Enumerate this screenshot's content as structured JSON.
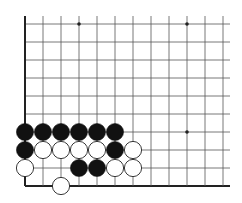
{
  "board": {
    "description": "Go board corner diagram (lower-left corner)",
    "origin_x": 25,
    "origin_y": 24,
    "spacing": 18,
    "cols": 12,
    "rows": 10,
    "right_extent": 230,
    "edges": {
      "left": true,
      "bottom": true,
      "top": false,
      "right": false
    },
    "line_color": "#555555",
    "edge_color": "#222222",
    "star_points": [
      {
        "col": 3,
        "row": 0
      },
      {
        "col": 9,
        "row": 0
      },
      {
        "col": 9,
        "row": 6
      }
    ],
    "stones": [
      {
        "color": "black",
        "col": 0,
        "row": 6
      },
      {
        "color": "black",
        "col": 1,
        "row": 6
      },
      {
        "color": "black",
        "col": 2,
        "row": 6
      },
      {
        "color": "black",
        "col": 3,
        "row": 6
      },
      {
        "color": "black",
        "col": 4,
        "row": 6
      },
      {
        "color": "black",
        "col": 5,
        "row": 6
      },
      {
        "color": "black",
        "col": 0,
        "row": 7
      },
      {
        "color": "white",
        "col": 1,
        "row": 7
      },
      {
        "color": "white",
        "col": 2,
        "row": 7
      },
      {
        "color": "white",
        "col": 3,
        "row": 7
      },
      {
        "color": "white",
        "col": 4,
        "row": 7
      },
      {
        "color": "black",
        "col": 5,
        "row": 7
      },
      {
        "color": "white",
        "col": 6,
        "row": 7
      },
      {
        "color": "white",
        "col": 0,
        "row": 8
      },
      {
        "color": "black",
        "col": 3,
        "row": 8
      },
      {
        "color": "black",
        "col": 4,
        "row": 8
      },
      {
        "color": "white",
        "col": 5,
        "row": 8
      },
      {
        "color": "white",
        "col": 6,
        "row": 8
      },
      {
        "color": "white",
        "col": 2,
        "row": 9
      }
    ],
    "colors": {
      "black_stone": "#111111",
      "white_stone": "#ffffff",
      "white_stone_outline": "#222222",
      "background": "#ffffff"
    }
  }
}
